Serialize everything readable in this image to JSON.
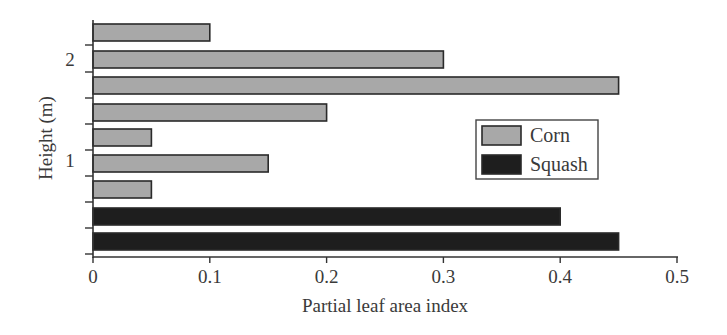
{
  "chart_data": {
    "type": "bar",
    "orientation": "horizontal",
    "title": "",
    "xlabel": "Partial leaf area index",
    "ylabel": "Height (m)",
    "xlim": [
      0,
      0.5
    ],
    "x_ticks": [
      "0",
      "0.1",
      "0.2",
      "0.3",
      "0.4",
      "0.5"
    ],
    "y_tick_labels": [
      {
        "label": "2",
        "position_index": 1
      },
      {
        "label": "1",
        "position_index": 5
      }
    ],
    "grid": false,
    "legend_position": "right-center",
    "legend": [
      {
        "name": "Corn",
        "color": "#a8a8a8"
      },
      {
        "name": "Squash",
        "color": "#1e1e1e"
      }
    ],
    "bars_top_to_bottom": [
      {
        "series": "Corn",
        "value": 0.1
      },
      {
        "series": "Corn",
        "value": 0.3
      },
      {
        "series": "Corn",
        "value": 0.45
      },
      {
        "series": "Corn",
        "value": 0.2
      },
      {
        "series": "Corn",
        "value": 0.05
      },
      {
        "series": "Corn",
        "value": 0.15
      },
      {
        "series": "Corn",
        "value": 0.05
      },
      {
        "series": "Squash",
        "value": 0.4
      },
      {
        "series": "Squash",
        "value": 0.45
      }
    ],
    "series": [
      {
        "name": "Corn",
        "values": [
          0.1,
          0.3,
          0.45,
          0.2,
          0.05,
          0.15,
          0.05,
          0,
          0
        ]
      },
      {
        "name": "Squash",
        "values": [
          0,
          0,
          0,
          0,
          0,
          0,
          0,
          0.4,
          0.45
        ]
      }
    ]
  }
}
